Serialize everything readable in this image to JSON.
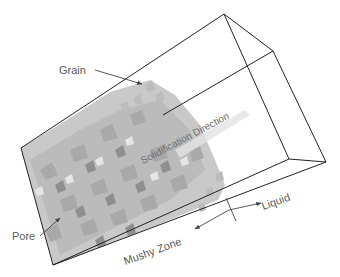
{
  "figure": {
    "labels": {
      "grain": "Grain",
      "pore": "Pore",
      "solidification_direction": "Solidification Direction",
      "liquid": "Liquid",
      "mushy_zone": "Mushy Zone"
    },
    "colors": {
      "box_edge": "#222222",
      "annotation_text": "#5a5a5a",
      "arrow": "#444444",
      "grain_fill_light": "#d8d8d8",
      "grain_fill_mid": "#bdbdbd",
      "grain_fill_dark": "#9a9a9a",
      "background": "#ffffff"
    }
  }
}
